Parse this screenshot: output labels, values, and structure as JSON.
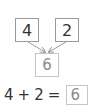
{
  "number_bond": {
    "part_a": "4",
    "part_b": "2",
    "whole": "6"
  },
  "equation": {
    "operand_a": "4",
    "operator": "+",
    "operand_b": "2",
    "equals": "=",
    "result": "6"
  },
  "colors": {
    "part_border": "#9a9a9a",
    "whole_border": "#c6c6c6",
    "arrow": "#9a9a9a",
    "text": "#333333",
    "whole_text": "#8a8a8a"
  }
}
